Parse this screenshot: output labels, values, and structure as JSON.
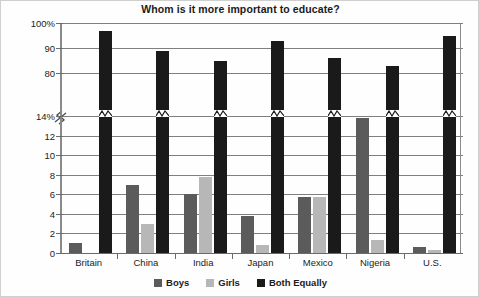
{
  "chart_data": {
    "type": "bar",
    "title": "Whom is it more important to educate?",
    "xlabel": "",
    "ylabel": "",
    "grid": true,
    "legend_position": "bottom",
    "axis_break": {
      "present": true,
      "lower_segment": [
        0,
        14
      ],
      "upper_segment": [
        80,
        100
      ],
      "note": "y-axis broken between 14% and 80%"
    },
    "yticks_upper": [
      "100%",
      "90",
      "80"
    ],
    "yticks_lower": [
      "14%",
      "12",
      "10",
      "8",
      "6",
      "4",
      "2",
      "0"
    ],
    "categories": [
      "Britain",
      "China",
      "India",
      "Japan",
      "Mexico",
      "Nigeria",
      "U.S."
    ],
    "series": [
      {
        "name": "Boys",
        "color": "#5b5b5b",
        "values": [
          1.0,
          7.0,
          6.0,
          3.8,
          5.7,
          13.8,
          0.6
        ]
      },
      {
        "name": "Girls",
        "color": "#b7b7b7",
        "values": [
          0.0,
          3.0,
          7.8,
          0.8,
          5.7,
          1.3,
          0.3
        ]
      },
      {
        "name": "Both Equally",
        "color": "#1a1a1a",
        "values": [
          97.0,
          89.0,
          85.0,
          93.0,
          86.0,
          83.0,
          95.0
        ]
      }
    ]
  },
  "legend": {
    "items": [
      {
        "label": "Boys",
        "color": "#5b5b5b"
      },
      {
        "label": "Girls",
        "color": "#b7b7b7"
      },
      {
        "label": "Both Equally",
        "color": "#1a1a1a"
      }
    ]
  }
}
